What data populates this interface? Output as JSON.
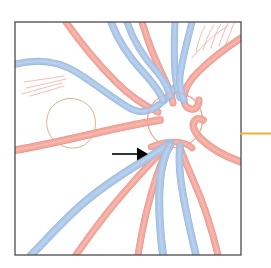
{
  "figure": {
    "background_color": "#ffffff",
    "panel": {
      "label": "fundus-panel",
      "border_color": "#4a4a4e",
      "border_width": 1.3,
      "x": 15,
      "y": 22,
      "width": 226,
      "height": 233,
      "fill": "#ffffff"
    },
    "optic_disc": {
      "label": "optic-disc",
      "outline_color": "#eda392",
      "outline_width": 1.0,
      "center_x": 175,
      "center_y": 120,
      "radius": 27.5
    },
    "macula_outline": {
      "label": "macula-outline",
      "outline_color": "#d8b48a",
      "outline_width": 1.0
    },
    "arrow": {
      "label": "pointer-arrow",
      "color": "#000000",
      "direction": "right",
      "tail_x": 112,
      "tail_y": 154,
      "head_x": 148,
      "head_y": 154,
      "shaft_width": 1.6,
      "head_length": 11,
      "head_half_height": 6.5
    },
    "callout_rule": {
      "label": "callout-rule",
      "color": "#e8b337",
      "width": 2.0,
      "x1": 240,
      "y1": 133.5,
      "x2": 271,
      "y2": 133.5
    },
    "colors": {
      "artery": "#f3a79d",
      "artery_edge": "#eb9387",
      "artery_light": "#f7c4bd",
      "vein": "#aac6e8",
      "vein_edge": "#97b7df",
      "vein_light": "#c6d9f0",
      "capillary": "#f0a79d",
      "macula": "#d8b48a",
      "border": "#4a4a4e",
      "callout": "#e8b337",
      "arrow": "#000000",
      "background": "#ffffff"
    },
    "legend": {
      "artery_name": "artery",
      "vein_name": "vein",
      "disc_name": "optic disc",
      "macula_name": "macula"
    },
    "vessel_counts": {
      "arteries": 9,
      "veins": 8,
      "capillaries": 11
    }
  },
  "chart_data": {
    "type": "diagram",
    "veins": [
      {
        "id": "vein-superior-nasal-arc",
        "width": 7.0,
        "path": "M 16 64 C 40 58, 60 62, 76 72 C 94 83, 110 96, 126 106 C 140 115, 150 112, 160 104 C 168 98, 172 93, 174 88"
      },
      {
        "id": "vein-superior-temporal-1",
        "width": 7.5,
        "path": "M 111 22 C 117 38, 128 56, 143 72 C 153 83, 160 92, 163 100"
      },
      {
        "id": "vein-superior-temporal-2",
        "width": 7.0,
        "path": "M 127 22 C 133 40, 144 58, 157 72 C 164 80, 168 88, 170 96"
      },
      {
        "id": "vein-superior-mid",
        "width": 7.0,
        "path": "M 175 22 C 174 40, 174 58, 175 74 C 176 84, 178 92, 180 98"
      },
      {
        "id": "vein-superior-right",
        "width": 7.0,
        "path": "M 192 22 C 187 42, 182 60, 180 76 C 179 86, 181 93, 184 100"
      },
      {
        "id": "vein-inferior-temporal-main",
        "width": 8.0,
        "path": "M 31 255 C 46 240, 62 222, 80 206 C 100 188, 122 174, 145 160 C 155 153, 163 148, 170 143"
      },
      {
        "id": "vein-inferior-central",
        "width": 8.0,
        "path": "M 163 255 C 160 232, 158 206, 160 182 C 161 168, 165 154, 170 145"
      },
      {
        "id": "vein-inferior-right",
        "width": 7.5,
        "path": "M 196 255 C 190 230, 184 204, 181 182 C 179 166, 179 154, 180 146"
      }
    ],
    "arteries": [
      {
        "id": "artery-superior-left",
        "width": 7.0,
        "path": "M 66 22 C 80 42, 98 64, 116 82 C 130 96, 145 106, 158 112"
      },
      {
        "id": "artery-superior-temporal",
        "width": 7.0,
        "path": "M 142 22 C 148 42, 156 62, 164 78 C 169 88, 172 96, 173 103"
      },
      {
        "id": "artery-superior-nasal-hook",
        "width": 7.0,
        "path": "M 241 38 C 226 48, 210 60, 198 72 C 190 80, 185 88, 184 96 C 183 103, 186 108, 191 109 C 196 110, 199 106, 199 100"
      },
      {
        "id": "artery-temporal-horizontal",
        "width": 7.5,
        "path": "M 16 150 C 40 146, 66 140, 92 134 C 118 128, 142 123, 160 120"
      },
      {
        "id": "artery-nasal-horizontal",
        "width": 7.5,
        "path": "M 241 162 C 224 156, 210 148, 200 138 C 194 131, 192 126, 194 122 C 196 118, 200 118, 203 120"
      },
      {
        "id": "artery-inferior-temporal",
        "width": 7.0,
        "path": "M 76 255 C 92 232, 110 208, 128 188 C 142 172, 155 158, 165 148"
      },
      {
        "id": "artery-inferior-central",
        "width": 7.0,
        "path": "M 138 255 C 142 230, 148 202, 156 178 C 161 163, 166 152, 170 146"
      },
      {
        "id": "artery-inferior-right",
        "width": 7.0,
        "path": "M 218 255 C 212 230, 204 204, 194 182 C 188 168, 183 156, 180 148"
      },
      {
        "id": "artery-disc-stub-lower",
        "width": 6.5,
        "path": "M 151 147 C 158 144, 166 142, 174 142 C 182 142, 188 144, 192 148"
      }
    ],
    "capillaries": [
      {
        "id": "capillary-left-1",
        "width": 0.9,
        "path": "M 24 82 C 38 80, 52 78, 64 76"
      },
      {
        "id": "capillary-left-2",
        "width": 0.9,
        "path": "M 26 88 C 40 85, 54 82, 66 79"
      },
      {
        "id": "capillary-left-3",
        "width": 0.9,
        "path": "M 22 94 C 36 90, 50 86, 62 83"
      },
      {
        "id": "capillary-left-4",
        "width": 0.9,
        "path": "M 30 96 C 42 93, 54 89, 64 86"
      },
      {
        "id": "capillary-topright-1",
        "width": 0.9,
        "path": "M 196 52 C 198 42, 201 33, 205 26"
      },
      {
        "id": "capillary-topright-2",
        "width": 0.9,
        "path": "M 203 50 C 206 40, 210 31, 214 25"
      },
      {
        "id": "capillary-topright-3",
        "width": 0.9,
        "path": "M 211 48 C 214 38, 217 30, 221 24"
      },
      {
        "id": "capillary-topright-4",
        "width": 0.9,
        "path": "M 219 46 C 222 37, 225 29, 228 23"
      },
      {
        "id": "capillary-topright-5",
        "width": 0.9,
        "path": "M 226 44 C 229 36, 232 28, 234 23"
      },
      {
        "id": "capillary-topright-arc",
        "width": 0.9,
        "path": "M 192 58 C 202 46, 214 34, 228 26"
      },
      {
        "id": "capillary-disc-branch",
        "width": 0.9,
        "path": "M 166 96 C 176 92, 188 94, 196 100"
      }
    ],
    "macula_path": "M 50 110 C 44 120, 46 134, 56 142 C 66 150, 80 150, 88 142 C 96 134, 98 120, 92 110 C 86 100, 72 96, 62 100 C 55 103, 52 106, 50 110"
  }
}
